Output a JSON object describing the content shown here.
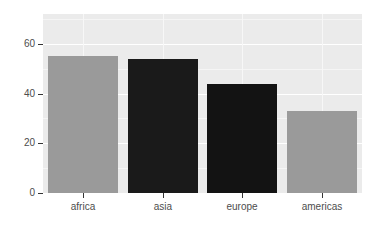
{
  "chart_data": {
    "type": "bar",
    "title": "",
    "subtitle": "",
    "xlabel": "",
    "ylabel": "",
    "categories": [
      "africa",
      "asia",
      "europe",
      "americas"
    ],
    "values": [
      55,
      54,
      44,
      33
    ],
    "ylim": [
      0,
      72
    ],
    "y_ticks": [
      "0",
      "20",
      "40",
      "60"
    ],
    "y_tick_values": [
      0,
      20,
      40,
      60
    ],
    "grid": "horizontal-major-and-minor",
    "legend": "none",
    "bar_colors": [
      "#9a9a9a",
      "#1a1a1a",
      "#131313",
      "#9a9a9a"
    ],
    "series": [
      {
        "name": "count",
        "values": [
          55,
          54,
          44,
          33
        ]
      }
    ]
  },
  "style": {
    "panel_background": "#ebebeb",
    "gridline_major_color": "#ffffff",
    "gridline_minor_color": "#f5f5f5",
    "page_background": "#ffffff",
    "axis_text_color": "#4d4d4d",
    "axis_tick_color": "#333333"
  }
}
